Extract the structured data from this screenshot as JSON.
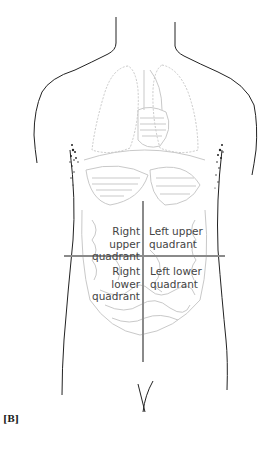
{
  "figure": {
    "tag": "[B]",
    "quadrants": {
      "right_upper": {
        "line1": "Right upper",
        "line2": "quadrant"
      },
      "left_upper": {
        "line1": "Left upper",
        "line2": "quadrant"
      },
      "right_lower": {
        "line1": "Right lower",
        "line2": "quadrant"
      },
      "left_lower": {
        "line1": "Left lower",
        "line2": "quadrant"
      }
    },
    "colors": {
      "outline": "#222222",
      "organs": "#c9c9c9",
      "divider_lines": "#8a8a8a",
      "label_text": "#444444"
    }
  }
}
